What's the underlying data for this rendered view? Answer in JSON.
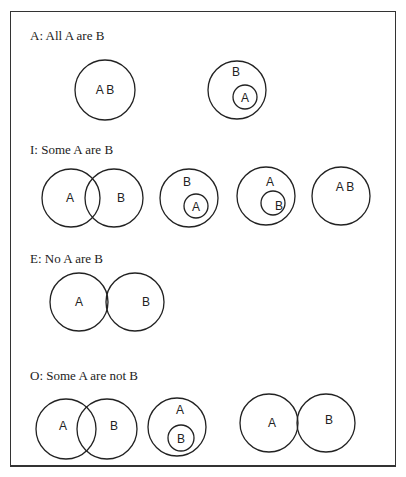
{
  "sections": [
    {
      "id": "A",
      "title": "A: All A are B",
      "diagrams": [
        {
          "circles": [
            {
              "cx": 105,
              "cy": 90,
              "r": 30
            }
          ],
          "labels": [
            {
              "text": "A B",
              "x": 105,
              "y": 94
            }
          ]
        },
        {
          "circles": [
            {
              "cx": 237,
              "cy": 90,
              "r": 29
            },
            {
              "cx": 245,
              "cy": 97,
              "r": 12
            }
          ],
          "labels": [
            {
              "text": "B",
              "x": 236,
              "y": 76
            },
            {
              "text": "A",
              "x": 245,
              "y": 102
            }
          ]
        }
      ]
    },
    {
      "id": "I",
      "title": "I: Some A are B",
      "diagrams": [
        {
          "circles": [
            {
              "cx": 71,
              "cy": 198,
              "r": 29
            },
            {
              "cx": 114,
              "cy": 198,
              "r": 29
            }
          ],
          "labels": [
            {
              "text": "A",
              "x": 70,
              "y": 202
            },
            {
              "text": "B",
              "x": 121,
              "y": 202
            }
          ]
        },
        {
          "circles": [
            {
              "cx": 189,
              "cy": 198,
              "r": 29
            },
            {
              "cx": 196,
              "cy": 206,
              "r": 12
            }
          ],
          "labels": [
            {
              "text": "B",
              "x": 187,
              "y": 186
            },
            {
              "text": "A",
              "x": 196,
              "y": 211
            }
          ]
        },
        {
          "circles": [
            {
              "cx": 266,
              "cy": 196,
              "r": 29
            },
            {
              "cx": 273,
              "cy": 203,
              "r": 12
            }
          ],
          "labels": [
            {
              "text": "A",
              "x": 270,
              "y": 186
            },
            {
              "text": "B",
              "x": 279,
              "y": 210
            }
          ]
        },
        {
          "circles": [
            {
              "cx": 341,
              "cy": 196,
              "r": 29
            }
          ],
          "labels": [
            {
              "text": "A B",
              "x": 345,
              "y": 191
            }
          ]
        }
      ]
    },
    {
      "id": "E",
      "title": "E: No A are B",
      "diagrams": [
        {
          "circles": [
            {
              "cx": 79,
              "cy": 302,
              "r": 29
            },
            {
              "cx": 135,
              "cy": 302,
              "r": 29
            }
          ],
          "labels": [
            {
              "text": "A",
              "x": 79,
              "y": 306
            },
            {
              "text": "B",
              "x": 146,
              "y": 306
            }
          ]
        }
      ]
    },
    {
      "id": "O",
      "title": "O: Some A are not B",
      "diagrams": [
        {
          "circles": [
            {
              "cx": 66,
              "cy": 429,
              "r": 30
            },
            {
              "cx": 107,
              "cy": 429,
              "r": 30
            }
          ],
          "labels": [
            {
              "text": "A",
              "x": 63,
              "y": 430
            },
            {
              "text": "B",
              "x": 114,
              "y": 430
            }
          ]
        },
        {
          "circles": [
            {
              "cx": 177,
              "cy": 427,
              "r": 29
            },
            {
              "cx": 181,
              "cy": 438,
              "r": 13
            }
          ],
          "labels": [
            {
              "text": "A",
              "x": 180,
              "y": 414
            },
            {
              "text": "B",
              "x": 181,
              "y": 443
            }
          ]
        },
        {
          "circles": [
            {
              "cx": 269,
              "cy": 423,
              "r": 29
            },
            {
              "cx": 326,
              "cy": 423,
              "r": 29
            }
          ],
          "labels": [
            {
              "text": "A",
              "x": 272,
              "y": 427
            },
            {
              "text": "B",
              "x": 329,
              "y": 424
            }
          ]
        }
      ]
    }
  ],
  "title_positions": {
    "A": {
      "x": 30,
      "y": 40
    },
    "I": {
      "x": 30,
      "y": 154
    },
    "E": {
      "x": 30,
      "y": 263
    },
    "O": {
      "x": 30,
      "y": 380
    }
  }
}
